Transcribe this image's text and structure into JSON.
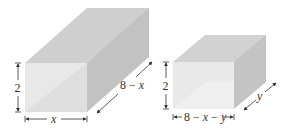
{
  "figure": {
    "box_left": {
      "height_label": "2",
      "width_label": "x",
      "depth_label": "8 − x"
    },
    "box_right": {
      "height_label": "2",
      "width_label": "8 − x − y",
      "depth_label": "y"
    }
  },
  "colors": {
    "front_face": "#e6e6e6",
    "front_face_diag": "#dcdcdc",
    "top_face": "#cfcfcf",
    "side_face": "#c4c4c4",
    "back_face": "#bcbcbc",
    "dimension_line": "#333333"
  }
}
